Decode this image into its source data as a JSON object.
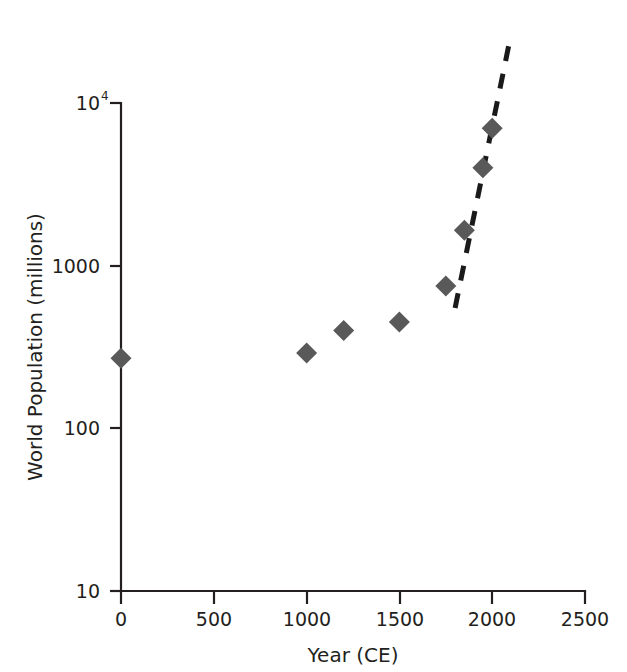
{
  "chart_data": {
    "type": "scatter",
    "title": "",
    "xlabel": "Year (CE)",
    "ylabel": "World Population (millions)",
    "xlim": [
      0,
      2500
    ],
    "ylim": [
      10,
      10000
    ],
    "yscale": "log",
    "xscale": "linear",
    "grid": false,
    "legend": false,
    "xticks": [
      {
        "value": 0,
        "label": "0"
      },
      {
        "value": 500,
        "label": "500"
      },
      {
        "value": 1000,
        "label": "1000"
      },
      {
        "value": 1500,
        "label": "1500"
      },
      {
        "value": 2000,
        "label": "2000"
      },
      {
        "value": 2500,
        "label": "2500"
      }
    ],
    "yticks": [
      {
        "value": 10,
        "label": "10",
        "sup": ""
      },
      {
        "value": 100,
        "label": "100",
        "sup": ""
      },
      {
        "value": 1000,
        "label": "1000",
        "sup": ""
      },
      {
        "value": 10000,
        "label": "10",
        "sup": "4"
      }
    ],
    "series": [
      {
        "name": "World population",
        "marker": "diamond",
        "color": "#595959",
        "x": [
          0,
          1000,
          1200,
          1500,
          1750,
          1850,
          1900,
          1950,
          2000
        ],
        "y": [
          270,
          290,
          400,
          450,
          750,
          1650,
          1650,
          4000,
          7000
        ],
        "points": [
          {
            "x": 0,
            "y": 270
          },
          {
            "x": 1000,
            "y": 290
          },
          {
            "x": 1200,
            "y": 400
          },
          {
            "x": 1500,
            "y": 450
          },
          {
            "x": 1750,
            "y": 750
          },
          {
            "x": 1850,
            "y": 1650
          },
          {
            "x": 1950,
            "y": 4000
          },
          {
            "x": 2000,
            "y": 7000
          }
        ]
      }
    ],
    "annotations": [
      {
        "type": "dashed-trend-line",
        "color": "#1a1a1a",
        "x_start": 1800,
        "y_start": 550,
        "x_end": 2100,
        "y_end": 26000
      }
    ]
  },
  "axis": {
    "x_title": "Year (CE)",
    "y_title": "World Population (millions)"
  }
}
